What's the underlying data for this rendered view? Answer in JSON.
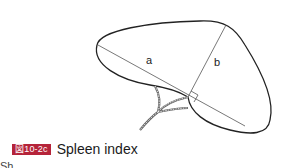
{
  "figure": {
    "label_a": "a",
    "label_b": "b"
  },
  "caption": {
    "badge": "図10-2c",
    "title": "Spleen index",
    "badge_color": "#b5243a"
  },
  "subtext": "Sh..."
}
